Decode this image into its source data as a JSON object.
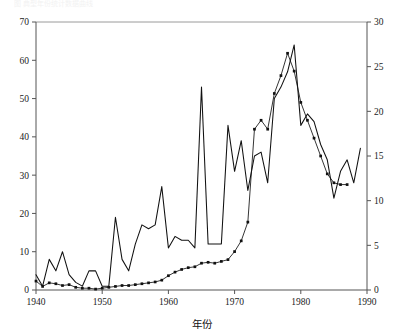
{
  "caption": {
    "text": "图 典型年份统计数据曲线"
  },
  "chart_data": {
    "type": "line",
    "title": "",
    "subtitle": "",
    "xlabel": "年份",
    "ylabel": "",
    "ylabel_right": "",
    "grid": false,
    "legend": "none",
    "xlim": [
      1940,
      1990
    ],
    "ylim": [
      0,
      70
    ],
    "ylim_right": [
      0,
      30
    ],
    "xticks": [
      1940,
      1950,
      1960,
      1970,
      1980,
      1990
    ],
    "xtick_labels": [
      "1940",
      "1950",
      "1960",
      "1970",
      "1980",
      "1990"
    ],
    "yticks": [
      0,
      10,
      20,
      30,
      40,
      50,
      60,
      70
    ],
    "ytick_labels": [
      "0",
      "10",
      "20",
      "30",
      "40",
      "50",
      "60",
      "70"
    ],
    "yticks_right": [
      0,
      5,
      10,
      15,
      20,
      25,
      30
    ],
    "ytick_labels_right": [
      "0",
      "5",
      "10",
      "15",
      "20",
      "25",
      "30"
    ],
    "series": [
      {
        "name": "solid-line-left-axis",
        "axis": "left",
        "marker": "none",
        "x": [
          1940,
          1941,
          1942,
          1943,
          1944,
          1945,
          1946,
          1947,
          1948,
          1949,
          1950,
          1951,
          1952,
          1953,
          1954,
          1955,
          1956,
          1957,
          1958,
          1959,
          1960,
          1961,
          1962,
          1963,
          1964,
          1965,
          1966,
          1967,
          1968,
          1969,
          1970,
          1971,
          1972,
          1973,
          1974,
          1975,
          1976,
          1977,
          1978,
          1979,
          1980,
          1981,
          1982,
          1983,
          1984,
          1985,
          1986,
          1987,
          1988,
          1989
        ],
        "values": [
          4,
          1,
          8,
          5,
          10,
          4,
          2,
          1,
          5,
          5,
          1,
          1,
          19,
          8,
          5,
          12,
          17,
          16,
          17,
          27,
          11,
          14,
          13,
          13,
          11,
          53,
          12,
          12,
          12,
          43,
          31,
          39,
          26,
          35,
          36,
          28,
          50,
          53,
          57,
          64,
          43,
          46,
          44,
          38,
          34,
          24,
          31,
          34,
          28,
          37
        ]
      },
      {
        "name": "marked-line-right-axis",
        "axis": "right",
        "marker": "filled-square",
        "x": [
          1940,
          1941,
          1942,
          1943,
          1944,
          1945,
          1946,
          1947,
          1948,
          1949,
          1950,
          1951,
          1952,
          1953,
          1954,
          1955,
          1956,
          1957,
          1958,
          1959,
          1960,
          1961,
          1962,
          1963,
          1964,
          1965,
          1966,
          1967,
          1968,
          1969,
          1970,
          1971,
          1972,
          1973,
          1974,
          1975,
          1976,
          1977,
          1978,
          1979,
          1980,
          1981,
          1982,
          1983,
          1984,
          1985,
          1986,
          1987
        ],
        "values": [
          1.0,
          0.4,
          0.8,
          0.7,
          0.5,
          0.6,
          0.3,
          0.2,
          0.2,
          0.1,
          0.2,
          0.3,
          0.4,
          0.5,
          0.5,
          0.6,
          0.7,
          0.8,
          0.9,
          1.1,
          1.6,
          2.0,
          2.3,
          2.5,
          2.6,
          3.0,
          3.1,
          3.0,
          3.2,
          3.4,
          4.3,
          5.5,
          7.6,
          18.0,
          19.0,
          18.0,
          22.0,
          24.0,
          26.5,
          24.5,
          21.0,
          19.0,
          17.0,
          15.0,
          13.0,
          12.0,
          11.8,
          11.8
        ]
      }
    ]
  }
}
